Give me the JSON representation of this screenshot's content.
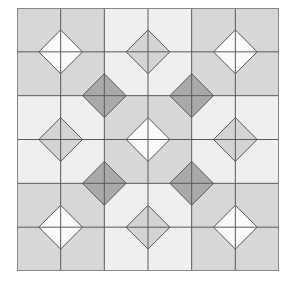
{
  "diagram": {
    "title": "",
    "type": "quilt-tile-pattern",
    "grid": {
      "rows": 6,
      "cols": 6,
      "block_rows": 3,
      "block_cols": 3
    },
    "colors": {
      "background": "#ffffff",
      "light_block": "#efefef",
      "gray_block": "#d7d7d7",
      "white_diamond": "#fafafa",
      "gray_diamond": "#d4d4d4",
      "dark_diamond": "#a9a9a9",
      "line": "#5a5a5a",
      "outer_border": "#888888"
    },
    "blocks": [
      [
        "gray",
        "light",
        "gray"
      ],
      [
        "light",
        "gray",
        "light"
      ],
      [
        "gray",
        "light",
        "gray"
      ]
    ],
    "dark_diamond_positions": [
      [
        2,
        2
      ],
      [
        2,
        4
      ],
      [
        4,
        2
      ],
      [
        4,
        4
      ]
    ]
  }
}
